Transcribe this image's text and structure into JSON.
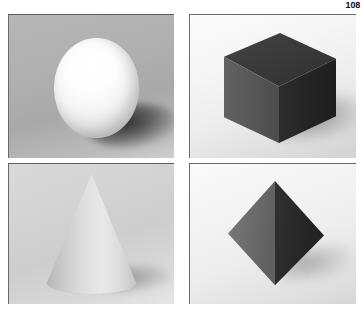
{
  "page": {
    "number": "108",
    "layout": "2x2 photographic plate grid"
  },
  "plates": [
    {
      "id": "sphere",
      "position": "top-left",
      "subject": "sphere",
      "subject_label": "Sphere",
      "object_color": "#f7f7f7",
      "background_color": "#b0b0b0",
      "shadow_direction": "lower-right",
      "lighting": "upper-left"
    },
    {
      "id": "cube",
      "position": "top-right",
      "subject": "cube",
      "subject_label": "Cube",
      "object_color": "#3a3a3a",
      "top_face_color": "#3a3a3a",
      "left_face_color": "#5a5a5a",
      "right_face_color": "#262626",
      "background_color": "#eeeeee",
      "shadow_direction": "right",
      "lighting": "upper-left"
    },
    {
      "id": "cone",
      "position": "bottom-left",
      "subject": "cone",
      "subject_label": "Cone",
      "object_color": "#d0d0d0",
      "background_color": "#d2d2d2",
      "shadow_direction": "lower-right",
      "lighting": "upper-right"
    },
    {
      "id": "octahedron",
      "position": "bottom-right",
      "subject": "octahedron",
      "subject_label": "Octahedron",
      "object_color": "#4a4a4a",
      "left_face_color": "#6e6e6e",
      "right_face_color": "#2a2a2a",
      "background_color": "#f0f0f0",
      "shadow_direction": "lower-right",
      "lighting": "upper-left"
    }
  ],
  "colors": {
    "page_background": "#ffffff",
    "page_number": "#0b0b0b",
    "plate_border": "#6a6a6a"
  }
}
